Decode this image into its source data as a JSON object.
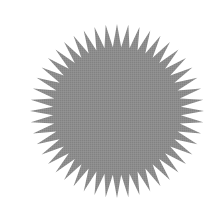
{
  "image": {
    "width": 220,
    "height": 220,
    "background": "#ffffff"
  },
  "shape": {
    "type": "starburst",
    "center": [
      117,
      111
    ],
    "outer_radius": 87,
    "inner_radius": 64,
    "spike_count": 48,
    "fill": "#8b8b8b",
    "texture": "dithered"
  }
}
